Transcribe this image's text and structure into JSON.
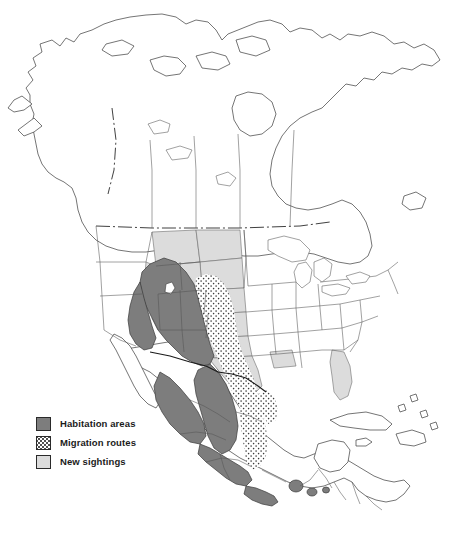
{
  "figure": {
    "kind": "thematic-distribution-map",
    "region": "North America",
    "background_color": "#ffffff",
    "outline_color": "#3a3a3a"
  },
  "legend": {
    "items": [
      {
        "id": "habitation",
        "label": "Habitation areas",
        "swatch": "solid-dark-gray",
        "color": "#7d7d7d"
      },
      {
        "id": "migration",
        "label": "Migration routes",
        "swatch": "stippled-dots",
        "color": "#444444"
      },
      {
        "id": "sightings",
        "label": "New sightings",
        "swatch": "solid-light-gray",
        "color": "#dcdcdc"
      }
    ]
  },
  "map_areas": {
    "habitation_regions": [
      "Nevada",
      "Utah",
      "Arizona",
      "New Mexico",
      "western Colorado",
      "northwestern Mexico",
      "Sonora",
      "Chihuahua",
      "Durango",
      "Sinaloa",
      "Zacatecas",
      "Jalisco",
      "Michoacan",
      "Guerrero",
      "Oaxaca patches"
    ],
    "migration_corridor": [
      "eastern New Mexico",
      "western Texas",
      "Coahuila",
      "Nuevo Leon",
      "Tamaulipas",
      "San Luis Potosi",
      "Veracruz"
    ],
    "new_sighting_regions": [
      "Montana",
      "Wyoming",
      "North Dakota",
      "South Dakota",
      "Nebraska",
      "Kansas",
      "Oklahoma",
      "Texas",
      "Louisiana",
      "Florida",
      "Idaho"
    ],
    "unshaded_regions": [
      "Alaska",
      "Canada",
      "Pacific Northwest",
      "California",
      "Midwest",
      "Great Lakes",
      "Northeast",
      "Southeast",
      "Baja California",
      "Yucatan",
      "Central America",
      "Caribbean"
    ]
  }
}
